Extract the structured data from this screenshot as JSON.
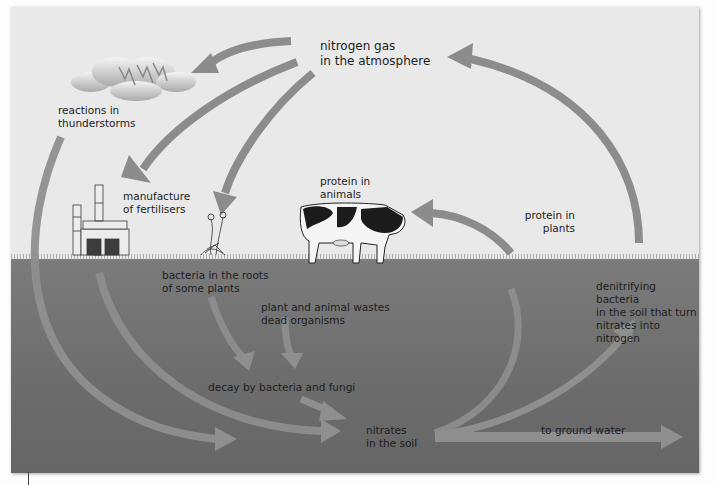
{
  "colors": {
    "sky": "#e9e9e9",
    "soil": "#707070",
    "arrow_sky": "#8c8c8c",
    "arrow_soil": "#8e8e8e",
    "text": "#1d1d1d"
  },
  "labels": {
    "nitrogen_gas": "nitrogen gas\nin the atmosphere",
    "thunderstorms": "reactions in\nthunderstorms",
    "fertilisers": "manufacture\nof fertilisers",
    "protein_animals": "protein in\nanimals",
    "protein_plants": "protein in\nplants",
    "bacteria_roots": "bacteria in the roots\nof some plants",
    "wastes": "plant and animal wastes\ndead organisms",
    "decay": "decay by bacteria and fungi",
    "nitrates": "nitrates\nin the soil",
    "ground_water": "to ground water",
    "denitrifying": "denitrifying bacteria\nin the soil that turn\nnitrates into nitrogen"
  },
  "icons": {
    "cloud": "thundercloud-icon",
    "factory": "factory-icon",
    "plant": "plant-icon",
    "cow": "cow-icon"
  }
}
